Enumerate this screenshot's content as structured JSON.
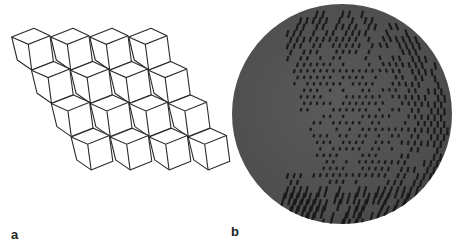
{
  "figure": {
    "panels": [
      {
        "label": "a",
        "description": "Isometric line drawing of stacked cubes",
        "grid": {
          "rows": 4,
          "cubes_per_row": 4,
          "col_step": [
            39,
            0
          ],
          "row_step": [
            19.8,
            33.3
          ]
        },
        "stroke_color": "#2a2a2a",
        "fill_color": "#ffffff"
      },
      {
        "label": "b",
        "description": "Voxelized sphere rendering",
        "center": [
          342,
          114
        ],
        "radius": 110,
        "base_color": "#555555",
        "dot_color": "#1a1a1a"
      }
    ]
  }
}
